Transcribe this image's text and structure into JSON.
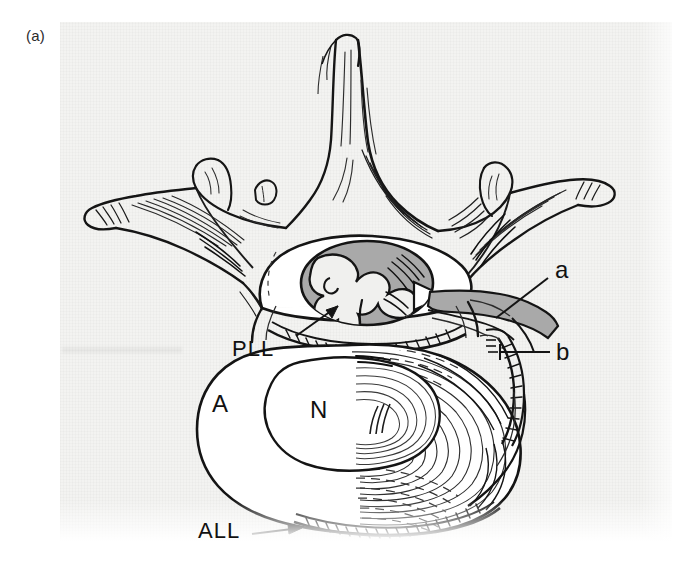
{
  "figure": {
    "panel_label": "(a)",
    "style": "black-and-white line drawing / scanned halftone plate",
    "background_color": "#f3f3f1",
    "ink_color": "#111111",
    "tissue_gray": "#a9a9a9",
    "dark_gray": "#8d8d8d"
  },
  "annotations": {
    "pll": {
      "label": "PLL",
      "meaning": "posterior longitudinal ligament",
      "leader": "arrow pointing up and to the right"
    },
    "all": {
      "label": "ALL",
      "meaning": "anterior longitudinal ligament",
      "leader": "arrow pointing to the right"
    },
    "annulus": {
      "label": "A",
      "meaning": "annulus fibrosus"
    },
    "nucleus": {
      "label": "N",
      "meaning": "nucleus pulposus"
    },
    "a": {
      "label": "a",
      "meaning": "spinal nerve root exiting the intervertebral foramen",
      "leader": "line running down and to the left"
    },
    "b": {
      "label": "b",
      "meaning": "lateral ligamentous attachment at the disc margin",
      "leader": "horizontal line running to the left"
    }
  },
  "structures": [
    {
      "name": "spinous-process",
      "description": "midline posterior bony projection, top of figure"
    },
    {
      "name": "lamina",
      "description": "paired plates sweeping laterally from the spinous process"
    },
    {
      "name": "superior-articular-process-left",
      "description": "upward hook lateral to the spinous process, left side"
    },
    {
      "name": "superior-articular-process-right",
      "description": "upward hook lateral to the spinous process, right side"
    },
    {
      "name": "transverse-process-left",
      "description": "long wing projecting down and to the left"
    },
    {
      "name": "transverse-process-right",
      "description": "long wing projecting up and to the right"
    },
    {
      "name": "vertebral-canal",
      "description": "oval space containing the spinal cord"
    },
    {
      "name": "spinal-cord",
      "description": "gray-filled oval with butterfly-shaped gray matter"
    },
    {
      "name": "pedicle",
      "description": "bony bridge joining vertebral body to the posterior arch"
    },
    {
      "name": "vertebral-body-disc",
      "description": "large rounded anterior mass, disc seen from above"
    },
    {
      "name": "annulus-lamellae",
      "description": "concentric hatched fibre rings filling the right half of the disc"
    },
    {
      "name": "nucleus-pulposus",
      "description": "irregular central oval, unshaded on the left half"
    },
    {
      "name": "nerve-root",
      "description": "gray band passing laterally to the right out of the canal"
    }
  ]
}
